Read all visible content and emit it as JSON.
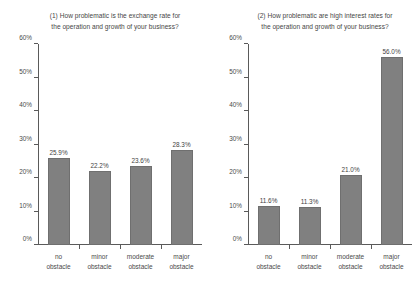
{
  "chart_data": [
    {
      "type": "bar",
      "title": "(1) How problematic is the exchange rate for the operation and growth of your business?",
      "title_line1": "(1) How problematic is the exchange rate for",
      "title_line2": "the operation and growth of your business?",
      "categories": [
        "no obstacle",
        "minor obstacle",
        "moderate obstacle",
        "major obstacle"
      ],
      "category_lines": [
        [
          "no",
          "obstacle"
        ],
        [
          "minor",
          "obstacle"
        ],
        [
          "moderate",
          "obstacle"
        ],
        [
          "major",
          "obstacle"
        ]
      ],
      "values": [
        25.9,
        22.2,
        23.6,
        28.3
      ],
      "value_labels": [
        "25.9%",
        "22.2%",
        "23.6%",
        "28.3%"
      ],
      "xlabel": "",
      "ylabel": "",
      "ylim": [
        0,
        60
      ],
      "yticks": [
        0,
        10,
        20,
        30,
        40,
        50,
        60
      ],
      "ytick_labels": [
        "0%",
        "10%",
        "20%",
        "30%",
        "40%",
        "50%",
        "60%"
      ],
      "grid": false,
      "legend": false,
      "bar_color": "#808080"
    },
    {
      "type": "bar",
      "title": "(2) How problematic are high interest rates for the operation and growth of your business?",
      "title_line1": "(2) How problematic are high interest rates for",
      "title_line2": "the operation and growth of your business?",
      "categories": [
        "no obstacle",
        "minor obstacle",
        "moderate obstacle",
        "major obstacle"
      ],
      "category_lines": [
        [
          "no",
          "obstacle"
        ],
        [
          "minor",
          "obstacle"
        ],
        [
          "moderate",
          "obstacle"
        ],
        [
          "major",
          "obstacle"
        ]
      ],
      "values": [
        11.6,
        11.3,
        21.0,
        56.0
      ],
      "value_labels": [
        "11.6%",
        "11.3%",
        "21.0%",
        "56.0%"
      ],
      "xlabel": "",
      "ylabel": "",
      "ylim": [
        0,
        60
      ],
      "yticks": [
        0,
        10,
        20,
        30,
        40,
        50,
        60
      ],
      "ytick_labels": [
        "0%",
        "10%",
        "20%",
        "30%",
        "40%",
        "50%",
        "60%"
      ],
      "grid": false,
      "legend": false,
      "bar_color": "#808080"
    }
  ]
}
